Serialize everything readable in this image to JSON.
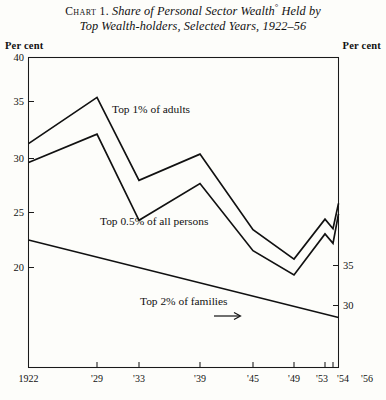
{
  "title": {
    "chart_number": "Chart 1.",
    "line1_text": "Share of Personal Sector Wealth",
    "footnote_mark": "°",
    "line1_tail": " Held by",
    "line2": "Top Wealth-holders, Selected Years, 1922–56"
  },
  "axes": {
    "left_caption": "Per cent",
    "right_caption": "Per cent",
    "left_ticks": [
      "40",
      "35",
      "30",
      "25",
      "20"
    ],
    "right_ticks": [
      "35",
      "30"
    ],
    "x_ticks": [
      "1922",
      "'29",
      "'33",
      "'39",
      "'45",
      "'49",
      "'53",
      "'54",
      "'56"
    ]
  },
  "annotations": {
    "series1_label": "Top 1% of adults",
    "series2_label": "Top 0.5% of all persons",
    "series3_label": "Top 2% of families",
    "series3_arrow": "arrow-right"
  },
  "chart_data": {
    "type": "line",
    "title": "Chart 1. Share of Personal Sector Wealth° Held by Top Wealth-holders, Selected Years, 1922–56",
    "xlabel": "",
    "ylabel": "Per cent",
    "grid": false,
    "legend": "inline-labels",
    "x": [
      "1922",
      "1929",
      "1933",
      "1939",
      "1945",
      "1949",
      "1953",
      "1954",
      "1956"
    ],
    "x_tick_labels": [
      "1922",
      "'29",
      "'33",
      "'39",
      "'45",
      "'49",
      "'53",
      "'54",
      "'56"
    ],
    "left_axis": {
      "ticks": [
        40,
        35,
        30,
        25,
        20
      ],
      "ylim": [
        15.5,
        40
      ]
    },
    "right_axis": {
      "ticks": [
        35,
        30
      ],
      "ylim": [
        21.5,
        45.7
      ],
      "note": "secondary scale used by 'Top 2% of families'"
    },
    "series": [
      {
        "name": "Top 1% of adults",
        "axis": "left",
        "x": [
          "1922",
          "1929",
          "1933",
          "1939",
          "1945",
          "1949",
          "1953",
          "1954",
          "1956"
        ],
        "values": [
          31.8,
          36.2,
          28.3,
          30.8,
          23.6,
          20.8,
          24.6,
          23.7,
          26.1
        ]
      },
      {
        "name": "Top 0.5% of all persons",
        "axis": "left",
        "x": [
          "1922",
          "1929",
          "1933",
          "1939",
          "1945",
          "1949",
          "1953",
          "1954",
          "1956"
        ],
        "values": [
          30.0,
          32.7,
          24.5,
          28.0,
          21.6,
          19.3,
          23.2,
          22.3,
          25.1
        ]
      },
      {
        "name": "Top 2% of families",
        "axis": "right",
        "x": [
          "1922",
          "1956"
        ],
        "values": [
          38.2,
          28.5
        ],
        "note": "single straight declining segment, read against right-hand scale"
      }
    ]
  }
}
